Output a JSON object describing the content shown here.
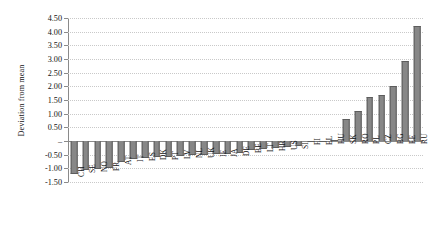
{
  "chart_data": {
    "type": "bar",
    "title": "",
    "subtitle": "",
    "xlabel": "",
    "ylabel": "Deviation from mean",
    "ylim": [
      -1.5,
      4.5
    ],
    "ytick_step": 0.5,
    "grid": true,
    "legend": false,
    "zero_tick_label": "–",
    "bar_color": "#878787",
    "bar_edge_color": "#5d5d5d",
    "axis_color": "#8a8a8a",
    "grid_color": "#c9c9c9",
    "ytick_labels": [
      "4.50",
      "4.00",
      "3.50",
      "3.00",
      "2.50",
      "2.00",
      "1.50",
      "1.00",
      "0.50",
      "–",
      "-0.50",
      "-1.00",
      "-1.50"
    ],
    "ytick_values": [
      4.5,
      4.0,
      3.5,
      3.0,
      2.5,
      2.0,
      1.5,
      1.0,
      0.5,
      0.0,
      -0.5,
      -1.0,
      -1.5
    ],
    "categories": [
      "CH",
      "SE",
      "NO",
      "FR",
      "AT",
      "IT",
      "ES",
      "DK",
      "PT",
      "LV",
      "NL",
      "UK",
      "IE",
      "JA",
      "DE",
      "BE",
      "LT",
      "HR",
      "US",
      "SI",
      "FI",
      "EL",
      "HU",
      "SK",
      "RO",
      "PL",
      "CZ",
      "BG",
      "EE",
      "RU"
    ],
    "values": [
      -1.22,
      -1.05,
      -1.02,
      -1.0,
      -0.75,
      -0.66,
      -0.63,
      -0.6,
      -0.58,
      -0.55,
      -0.53,
      -0.5,
      -0.48,
      -0.46,
      -0.44,
      -0.32,
      -0.28,
      -0.25,
      -0.22,
      -0.18,
      -0.04,
      -0.03,
      0.04,
      0.8,
      1.08,
      1.62,
      1.7,
      2.02,
      2.92,
      4.22
    ]
  }
}
